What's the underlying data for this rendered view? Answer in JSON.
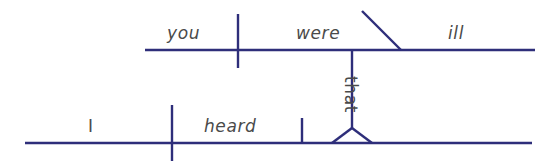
{
  "diagram": {
    "kind": "reed-kellogg-sentence-diagram",
    "sentence": "I heard that you were ill",
    "stroke_color": "#2e2e7a",
    "text_color": "#4a4a4a",
    "background_color": "#ffffff",
    "clauses": [
      {
        "name": "subordinate-clause",
        "role": "noun clause serving as direct object",
        "baseline": {
          "x1": 145,
          "y1": 50,
          "x2": 535,
          "y2": 50
        },
        "parts": [
          {
            "name": "subject",
            "label": "you",
            "x": 167,
            "y": 25
          },
          {
            "name": "verb",
            "label": "were",
            "x": 296,
            "y": 25
          },
          {
            "name": "predicate-adjective",
            "label": "ill",
            "x": 448,
            "y": 25
          }
        ],
        "dividers": [
          {
            "name": "subject-verb-divider",
            "x": 238,
            "y_top": 14,
            "y_bottom": 68,
            "style": "full-cross"
          }
        ],
        "slants": [
          {
            "name": "predicate-adjective-slant",
            "x1": 362,
            "y1": 11,
            "x2": 401,
            "y2": 50
          }
        ]
      },
      {
        "name": "main-clause",
        "role": "independent clause",
        "baseline": {
          "x1": 25,
          "y1": 143,
          "x2": 532,
          "y2": 143
        },
        "parts": [
          {
            "name": "subject",
            "label": "I",
            "x": 88,
            "y": 118
          },
          {
            "name": "verb",
            "label": "heard",
            "x": 204,
            "y": 118
          }
        ],
        "dividers": [
          {
            "name": "subject-verb-divider",
            "x": 172,
            "y_top": 105,
            "y_bottom": 161,
            "style": "full-cross"
          },
          {
            "name": "verb-object-divider",
            "x": 302,
            "y_top": 118,
            "y_bottom": 143,
            "style": "half-up"
          }
        ]
      }
    ],
    "connector": {
      "name": "clause-connector",
      "label": "that",
      "label_x": 359,
      "label_y": 76,
      "line": {
        "x": 352,
        "y_top": 50,
        "y_bottom": 128
      },
      "stand": {
        "name": "tripod-stand",
        "apex_x": 352,
        "apex_y": 128,
        "left_x": 332,
        "right_x": 372,
        "base_y": 143
      }
    }
  }
}
